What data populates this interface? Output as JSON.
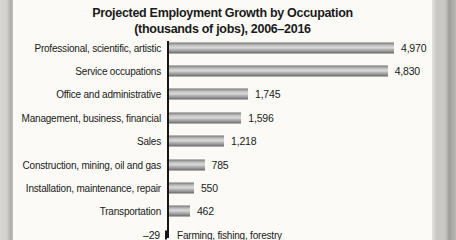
{
  "chart": {
    "title_line1": "Projected Employment Growth by Occupation",
    "title_line2": "(thousands of jobs), 2006–2016"
  },
  "chart_data": {
    "type": "bar",
    "orientation": "horizontal",
    "title": "Projected Employment Growth by Occupation",
    "subtitle": "(thousands of jobs), 2006–2016",
    "unit": "thousands of jobs",
    "categories": [
      "Professional, scientific, artistic",
      "Service occupations",
      "Office and administrative",
      "Management, business, financial",
      "Sales",
      "Construction, mining, oil and gas",
      "Installation, maintenance, repair",
      "Transportation",
      "Farming, fishing, forestry"
    ],
    "values": [
      4970,
      4830,
      1745,
      1596,
      1218,
      785,
      550,
      462,
      -29
    ],
    "value_labels": [
      "4,970",
      "4,830",
      "1,745",
      "1,596",
      "1,218",
      "785",
      "550",
      "462",
      "–29"
    ],
    "xlim": [
      -100,
      5000
    ],
    "xlabel": "",
    "ylabel": "",
    "grid": false,
    "legend": false,
    "data_labels_shown": true
  },
  "colors": {
    "text": "#1a1a1a",
    "axis": "#161616",
    "bar_light": "#d9d9d9",
    "bar_dark": "#626262",
    "page_background": "#fbfaf6",
    "scan_edge_gray": "#cdcbc7"
  }
}
